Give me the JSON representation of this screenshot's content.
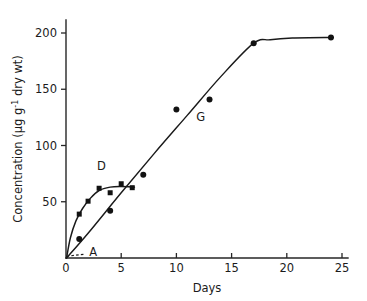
{
  "chart_data": {
    "type": "scatter",
    "title": "",
    "xlabel": "Days",
    "ylabel": "Concentration (μg g⁻¹ dry wt)",
    "ylabel_parts": {
      "main": "Concentration (μg g",
      "exponent": "-1",
      "tail": " dry wt)"
    },
    "xlim": [
      0,
      25
    ],
    "ylim": [
      0,
      215
    ],
    "xticks": [
      "0",
      "5",
      "10",
      "15",
      "20",
      "25"
    ],
    "xtick_values": [
      0,
      5,
      10,
      15,
      20,
      25
    ],
    "yticks": [
      "50",
      "100",
      "150",
      "200"
    ],
    "ytick_values": [
      50,
      100,
      150,
      200
    ],
    "grid": false,
    "legend": "none",
    "series": [
      {
        "name": "D",
        "label": "D",
        "marker": "square",
        "label_x": 3.2,
        "label_y": 78,
        "x": [
          1.2,
          2.0,
          3.0,
          4.0,
          5.0,
          6.0
        ],
        "values": [
          39,
          50.5,
          62,
          58,
          66,
          62.5
        ],
        "curve_x": [
          0.05,
          0.4,
          0.9,
          1.5,
          2.2,
          3.0,
          4.0,
          5.0,
          6.2
        ],
        "curve_y": [
          0,
          18,
          33,
          44,
          53,
          60,
          63,
          63.5,
          63
        ]
      },
      {
        "name": "G",
        "label": "G",
        "marker": "circle",
        "label_x": 12.2,
        "label_y": 122,
        "x": [
          1.2,
          4.0,
          7.0,
          10.0,
          13.0,
          17.0,
          24.0
        ],
        "values": [
          17,
          42,
          74,
          132,
          141,
          191,
          196
        ],
        "curve_x": [
          0.05,
          2.0,
          5.0,
          8.0,
          11.0,
          14.0,
          17.0,
          18.5,
          20.5,
          24.2
        ],
        "curve_y": [
          0,
          22,
          58,
          93,
          127,
          161,
          191,
          194,
          195.5,
          196
        ]
      }
    ],
    "annotations": [
      {
        "name": "A",
        "label": "A",
        "type": "dashed-line",
        "x_start": 0.05,
        "y_start": 1.5,
        "x_end": 1.75,
        "y_end": 3.5,
        "label_x": 2.1,
        "label_y": 5.5
      }
    ],
    "colors": {
      "axis": "#262626",
      "curve": "#1a1a1a",
      "marker": "#121212",
      "text": "#1b1b1b",
      "background": "#ffffff"
    }
  }
}
